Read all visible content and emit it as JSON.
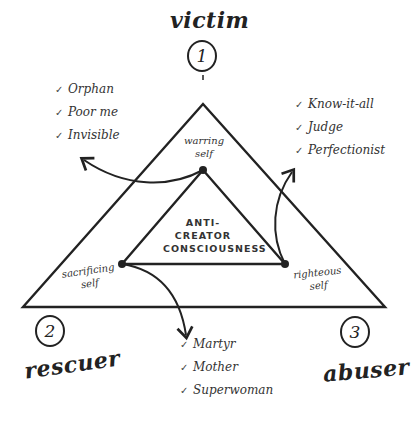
{
  "diagram": {
    "center_label_lines": [
      "ANTI-",
      "CREATOR",
      "CONSCIOUSNESS"
    ],
    "roles": [
      {
        "number": "1",
        "name": "victim",
        "self": [
          "warring",
          "self"
        ],
        "traits": [
          "Orphan",
          "Poor me",
          "Invisible"
        ]
      },
      {
        "number": "2",
        "name": "rescuer",
        "self": [
          "sacrificing",
          "self"
        ],
        "traits": [
          "Martyr",
          "Mother",
          "Superwoman"
        ]
      },
      {
        "number": "3",
        "name": "abuser",
        "self": [
          "righteous",
          "self"
        ],
        "traits": [
          "Know-it-all",
          "Judge",
          "Perfectionist"
        ]
      }
    ],
    "check_glyph": "✓",
    "line_color": "#222222"
  }
}
